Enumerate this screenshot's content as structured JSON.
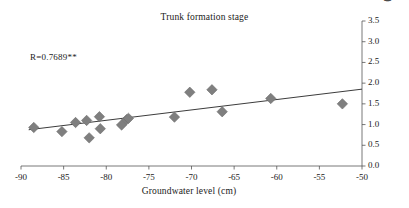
{
  "chart_data": {
    "type": "scatter",
    "title": "Trunk formation stage",
    "xlabel": "Groundwater level (cm)",
    "ylabel": "Trunk height increase rate (m/year)",
    "xlim": [
      -90,
      -50
    ],
    "ylim": [
      0.0,
      3.5
    ],
    "xticks": [
      -90,
      -85,
      -80,
      -75,
      -70,
      -65,
      -60,
      -55,
      -50
    ],
    "xtick_labels": [
      "-90",
      "-85",
      "-80",
      "-75",
      "-70",
      "-65",
      "-60",
      "-55",
      "-50"
    ],
    "yticks": [
      0.0,
      0.5,
      1.0,
      1.5,
      2.0,
      2.5,
      3.0,
      3.5
    ],
    "ytick_labels": [
      "0.0",
      "0.5",
      "1.0",
      "1.5",
      "2.0",
      "2.5",
      "3.0",
      "3.5"
    ],
    "y_axis_position": "right",
    "grid": false,
    "legend": "none",
    "annotation": "R=0.7689**",
    "marker": "diamond",
    "marker_color": "#7f7f7f",
    "line_color": "#3c3c3c",
    "points": [
      {
        "x": -88.5,
        "y": 0.93
      },
      {
        "x": -85.2,
        "y": 0.83
      },
      {
        "x": -83.6,
        "y": 1.05
      },
      {
        "x": -82.3,
        "y": 1.1
      },
      {
        "x": -82.0,
        "y": 0.68
      },
      {
        "x": -80.8,
        "y": 1.19
      },
      {
        "x": -80.7,
        "y": 0.9
      },
      {
        "x": -78.2,
        "y": 0.99
      },
      {
        "x": -77.6,
        "y": 1.12
      },
      {
        "x": -77.4,
        "y": 1.15
      },
      {
        "x": -72.0,
        "y": 1.18
      },
      {
        "x": -70.2,
        "y": 1.78
      },
      {
        "x": -67.6,
        "y": 1.84
      },
      {
        "x": -66.4,
        "y": 1.31
      },
      {
        "x": -60.7,
        "y": 1.63
      },
      {
        "x": -52.3,
        "y": 1.5
      }
    ],
    "trendline": {
      "x_start": -89.1,
      "y_start": 0.875,
      "x_end": -50.0,
      "y_end": 1.855
    }
  }
}
